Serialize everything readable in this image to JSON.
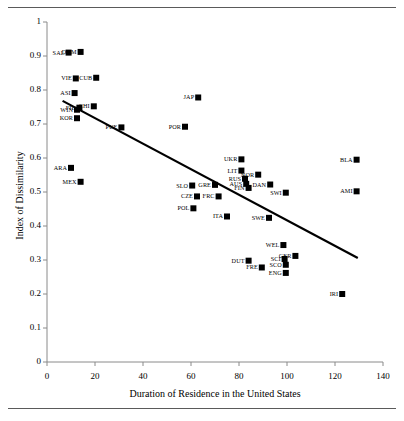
{
  "figure": {
    "frame_top_rule": true,
    "frame_bottom_rule": true
  },
  "chart_data": {
    "type": "scatter",
    "title": "",
    "xlabel": "Duration of Residence in the United States",
    "ylabel": "Index of Dissimilarity",
    "xlim": [
      0,
      140
    ],
    "ylim": [
      0,
      1
    ],
    "xticks": [
      "0",
      "20",
      "40",
      "60",
      "80",
      "100",
      "120",
      "140"
    ],
    "yticks": [
      "0",
      "0.1",
      "0.2",
      "0.3",
      "0.4",
      "0.5",
      "0.6",
      "0.7",
      "0.8",
      "0.9",
      "1"
    ],
    "grid": false,
    "legend": "none",
    "marker": "filled-square",
    "marker_color": "#000000",
    "trendline": {
      "type": "linear",
      "color": "#000000",
      "x_start": 6.5,
      "y_start": 0.768,
      "x_end": 129.5,
      "y_end": 0.306
    },
    "points": [
      {
        "label": "SAL",
        "x": 9.0,
        "y": 0.91,
        "label_pos": "left"
      },
      {
        "label": "DOM",
        "x": 14.0,
        "y": 0.912,
        "label_pos": "left"
      },
      {
        "label": "VIE",
        "x": 12.0,
        "y": 0.834,
        "label_pos": "left"
      },
      {
        "label": "CUB",
        "x": 20.5,
        "y": 0.836,
        "label_pos": "left"
      },
      {
        "label": "ASI",
        "x": 11.5,
        "y": 0.791,
        "label_pos": "left"
      },
      {
        "label": "FIL",
        "x": 13.5,
        "y": 0.748,
        "label_pos": "left"
      },
      {
        "label": "CHI",
        "x": 19.5,
        "y": 0.752,
        "label_pos": "left"
      },
      {
        "label": "WIN",
        "x": 12.5,
        "y": 0.742,
        "label_pos": "left"
      },
      {
        "label": "KOR",
        "x": 12.5,
        "y": 0.717,
        "label_pos": "left"
      },
      {
        "label": "PUE",
        "x": 31.0,
        "y": 0.69,
        "label_pos": "left"
      },
      {
        "label": "ARA",
        "x": 10.0,
        "y": 0.571,
        "label_pos": "left"
      },
      {
        "label": "MEX",
        "x": 14.0,
        "y": 0.53,
        "label_pos": "left"
      },
      {
        "label": "JAP",
        "x": 63.0,
        "y": 0.778,
        "label_pos": "left"
      },
      {
        "label": "POR",
        "x": 57.5,
        "y": 0.692,
        "label_pos": "left"
      },
      {
        "label": "UKR",
        "x": 81.0,
        "y": 0.596,
        "label_pos": "left"
      },
      {
        "label": "LIT",
        "x": 81.0,
        "y": 0.563,
        "label_pos": "left"
      },
      {
        "label": "NOR",
        "x": 88.0,
        "y": 0.551,
        "label_pos": "left"
      },
      {
        "label": "RUS",
        "x": 82.5,
        "y": 0.539,
        "label_pos": "left"
      },
      {
        "label": "AUS",
        "x": 83.0,
        "y": 0.524,
        "label_pos": "left"
      },
      {
        "label": "DAN",
        "x": 93.0,
        "y": 0.522,
        "label_pos": "left"
      },
      {
        "label": "FIN",
        "x": 84.0,
        "y": 0.512,
        "label_pos": "left"
      },
      {
        "label": "SWI",
        "x": 99.5,
        "y": 0.498,
        "label_pos": "left"
      },
      {
        "label": "SLO",
        "x": 60.5,
        "y": 0.519,
        "label_pos": "left"
      },
      {
        "label": "GRE",
        "x": 70.0,
        "y": 0.521,
        "label_pos": "left"
      },
      {
        "label": "CZE",
        "x": 62.5,
        "y": 0.487,
        "label_pos": "left"
      },
      {
        "label": "FRC",
        "x": 71.5,
        "y": 0.487,
        "label_pos": "left"
      },
      {
        "label": "POL",
        "x": 61.0,
        "y": 0.452,
        "label_pos": "left"
      },
      {
        "label": "ITA",
        "x": 75.0,
        "y": 0.428,
        "label_pos": "left"
      },
      {
        "label": "SWE",
        "x": 92.5,
        "y": 0.424,
        "label_pos": "left"
      },
      {
        "label": "WEL",
        "x": 98.5,
        "y": 0.344,
        "label_pos": "left"
      },
      {
        "label": "GER",
        "x": 103.5,
        "y": 0.312,
        "label_pos": "left"
      },
      {
        "label": "SCI",
        "x": 99.0,
        "y": 0.303,
        "label_pos": "left"
      },
      {
        "label": "SCO",
        "x": 99.5,
        "y": 0.286,
        "label_pos": "left"
      },
      {
        "label": "ENG",
        "x": 99.5,
        "y": 0.262,
        "label_pos": "left"
      },
      {
        "label": "DUT",
        "x": 84.0,
        "y": 0.298,
        "label_pos": "left"
      },
      {
        "label": "FRE",
        "x": 89.5,
        "y": 0.278,
        "label_pos": "left"
      },
      {
        "label": "BLA",
        "x": 129.0,
        "y": 0.595,
        "label_pos": "left"
      },
      {
        "label": "AMI",
        "x": 129.0,
        "y": 0.502,
        "label_pos": "left"
      },
      {
        "label": "IRI",
        "x": 123.0,
        "y": 0.2,
        "label_pos": "left"
      }
    ]
  }
}
